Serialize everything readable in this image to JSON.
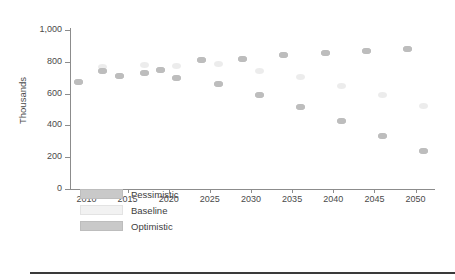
{
  "chart_data": {
    "type": "scatter",
    "title": "",
    "xlabel": "",
    "ylabel": "Thousands",
    "xlim": [
      2008,
      2052
    ],
    "ylim": [
      0,
      1000
    ],
    "grid": false,
    "legend_position": "inside-bottom-left",
    "ytick_labels": [
      "0",
      "200",
      "400",
      "600",
      "800",
      "1,000"
    ],
    "ytick_values": [
      0,
      200,
      400,
      600,
      800,
      1000
    ],
    "xtick_labels": [
      "2010",
      "2015",
      "2020",
      "2025",
      "2030",
      "2035",
      "2040",
      "2045",
      "2050"
    ],
    "xtick_values": [
      2010,
      2015,
      2020,
      2025,
      2030,
      2035,
      2040,
      2045,
      2050
    ],
    "x": [
      2009,
      2012,
      2014,
      2017,
      2019,
      2021,
      2024,
      2026,
      2029,
      2031,
      2034,
      2036,
      2039,
      2041,
      2044,
      2046,
      2049,
      2051
    ],
    "series": [
      {
        "name": "Pessimistic",
        "color": "#b9b9b9",
        "values": [
          670,
          740,
          710,
          730,
          750,
          695,
          810,
          660,
          820,
          590,
          840,
          515,
          855,
          425,
          870,
          335,
          880,
          240
        ]
      },
      {
        "name": "Baseline",
        "color": "#ececec",
        "values": [
          670,
          765,
          710,
          780,
          750,
          775,
          810,
          785,
          820,
          745,
          840,
          705,
          855,
          650,
          870,
          590,
          880,
          520
        ]
      },
      {
        "name": "Optimistic",
        "color": "#bdbdbd",
        "values": [
          670,
          740,
          710,
          730,
          750,
          695,
          810,
          660,
          820,
          590,
          840,
          515,
          855,
          425,
          870,
          335,
          880,
          240
        ]
      }
    ],
    "points": [
      {
        "x": 2009,
        "pessimistic": 670,
        "baseline": 670,
        "optimistic": 670
      },
      {
        "x": 2012,
        "pessimistic": 740,
        "baseline": 765,
        "optimistic": 740
      },
      {
        "x": 2014,
        "pessimistic": 710,
        "baseline": 710,
        "optimistic": 710
      },
      {
        "x": 2017,
        "pessimistic": 730,
        "baseline": 780,
        "optimistic": 730
      },
      {
        "x": 2019,
        "pessimistic": 750,
        "baseline": 750,
        "optimistic": 750
      },
      {
        "x": 2021,
        "pessimistic": 695,
        "baseline": 775,
        "optimistic": 695
      },
      {
        "x": 2024,
        "pessimistic": 810,
        "baseline": 810,
        "optimistic": 810
      },
      {
        "x": 2026,
        "pessimistic": 660,
        "baseline": 785,
        "optimistic": 660
      },
      {
        "x": 2029,
        "pessimistic": 820,
        "baseline": 820,
        "optimistic": 820
      },
      {
        "x": 2031,
        "pessimistic": 590,
        "baseline": 745,
        "optimistic": 590
      },
      {
        "x": 2034,
        "pessimistic": 840,
        "baseline": 840,
        "optimistic": 840
      },
      {
        "x": 2036,
        "pessimistic": 515,
        "baseline": 705,
        "optimistic": 515
      },
      {
        "x": 2039,
        "pessimistic": 855,
        "baseline": 855,
        "optimistic": 855
      },
      {
        "x": 2041,
        "pessimistic": 425,
        "baseline": 650,
        "optimistic": 425
      },
      {
        "x": 2044,
        "pessimistic": 870,
        "baseline": 870,
        "optimistic": 870
      },
      {
        "x": 2046,
        "pessimistic": 335,
        "baseline": 590,
        "optimistic": 335
      },
      {
        "x": 2049,
        "pessimistic": 880,
        "baseline": 880,
        "optimistic": 880
      },
      {
        "x": 2051,
        "pessimistic": 240,
        "baseline": 520,
        "optimistic": 240
      }
    ]
  },
  "legend": {
    "items": [
      {
        "label": "Pessimistic",
        "color": "#c9c9c9"
      },
      {
        "label": "Baseline",
        "color": "#f2f2f2"
      },
      {
        "label": "Optimistic",
        "color": "#c9c9c9"
      }
    ]
  }
}
